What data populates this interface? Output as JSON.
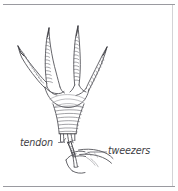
{
  "figure": {
    "medium": "hand-drawn ink line illustration",
    "background_color": "#ffffff",
    "ink_color": "#55555a",
    "frame": {
      "top_rule": true,
      "bottom_rule": true,
      "right_rule": true,
      "left_rule": false,
      "rule_color": "#9a9aa0"
    },
    "labels": [
      {
        "id": "tendon",
        "text": "tendon",
        "x": 20,
        "y": 146,
        "leader_to_x": 70,
        "leader_to_y": 136,
        "anchor": "start"
      },
      {
        "id": "tweezers",
        "text": "tweezers",
        "x": 108,
        "y": 154,
        "leader_to_x": 90,
        "leader_to_y": 152,
        "anchor": "start"
      }
    ],
    "subjects": [
      {
        "id": "bird-foot",
        "name": "chicken foot",
        "toes": 4,
        "claws": 4,
        "scales": "segmented scutes"
      },
      {
        "id": "cut-shank",
        "name": "severed leg end",
        "strands": "exposed tendons"
      },
      {
        "id": "tweezers",
        "name": "tweezers",
        "held_by": "hand"
      },
      {
        "id": "hand",
        "name": "human hand gripping tweezers"
      }
    ]
  }
}
